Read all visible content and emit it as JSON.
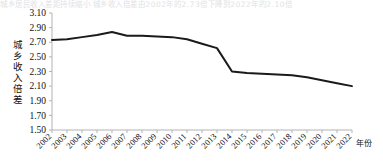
{
  "figure": {
    "background_color": "#ffffff",
    "line_color": "#1a1a1a",
    "axis_color": "#b3b3b3",
    "text_color": "#111111",
    "bleed_text": "城乡居民收入差距持续缩小    城乡收入倍差由2002年的2.73倍下降到2022年的2.10倍"
  },
  "chart_data": {
    "type": "line",
    "title": "",
    "xlabel": "年份",
    "ylabel": "城乡收入倍差",
    "xlim": [
      2002,
      2022
    ],
    "ylim": [
      1.5,
      3.1
    ],
    "ytick_step": 0.2,
    "grid": false,
    "legend": false,
    "categories": [
      "2002",
      "2003",
      "2004",
      "2005",
      "2006",
      "2007",
      "2008",
      "2009",
      "2010",
      "2011",
      "2012",
      "2013",
      "2014",
      "2015",
      "2016",
      "2017",
      "2018",
      "2019",
      "2020",
      "2021",
      "2022"
    ],
    "ytick_labels": [
      "3.10",
      "2.90",
      "2.70",
      "2.50",
      "2.30",
      "2.10",
      "1.90",
      "1.70",
      "1.50"
    ],
    "ytick_values": [
      3.1,
      2.9,
      2.7,
      2.5,
      2.3,
      2.1,
      1.9,
      1.7,
      1.5
    ],
    "series": [
      {
        "name": "城乡收入倍差",
        "values": [
          2.73,
          2.74,
          2.77,
          2.8,
          2.84,
          2.79,
          2.79,
          2.78,
          2.77,
          2.74,
          2.68,
          2.62,
          2.3,
          2.28,
          2.27,
          2.26,
          2.25,
          2.22,
          2.18,
          2.14,
          2.1
        ]
      }
    ]
  }
}
